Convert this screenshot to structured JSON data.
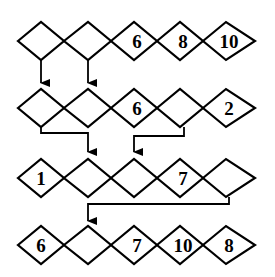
{
  "diagram": {
    "rows": [
      {
        "cells": [
          "",
          "",
          "6",
          "8",
          "10"
        ]
      },
      {
        "cells": [
          "",
          "",
          "6",
          "",
          "2"
        ]
      },
      {
        "cells": [
          "1",
          "",
          "",
          "7",
          ""
        ]
      },
      {
        "cells": [
          "6",
          "",
          "7",
          "10",
          "8"
        ]
      }
    ],
    "arrows": [
      {
        "from": "row1-cell1",
        "to": "row2-cell1"
      },
      {
        "from": "row1-cell2",
        "to": "row2-cell2"
      },
      {
        "from": "row2-cell1",
        "to": "row3-cell2"
      },
      {
        "from": "row2-cell4",
        "to": "row3-cell3"
      },
      {
        "from": "row3-cell5",
        "to": "row4-cell2"
      }
    ]
  }
}
